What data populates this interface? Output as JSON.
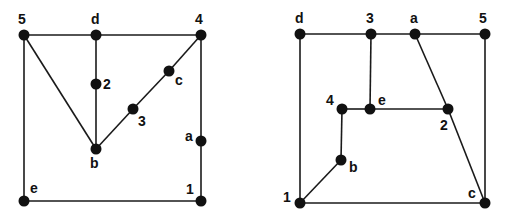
{
  "colors": {
    "background": "#ffffff",
    "ink": "#111111"
  },
  "graphs": [
    {
      "name": "left-graph",
      "nodes": [
        {
          "id": "5",
          "x": 24,
          "y": 35,
          "lx": 18,
          "ly": 24
        },
        {
          "id": "d",
          "x": 96,
          "y": 35,
          "lx": 91,
          "ly": 24
        },
        {
          "id": "4",
          "x": 201,
          "y": 35,
          "lx": 195,
          "ly": 24
        },
        {
          "id": "2",
          "x": 96,
          "y": 84,
          "lx": 103,
          "ly": 89
        },
        {
          "id": "c",
          "x": 169,
          "y": 71,
          "lx": 175,
          "ly": 85
        },
        {
          "id": "3",
          "x": 133,
          "y": 109,
          "lx": 138,
          "ly": 126
        },
        {
          "id": "b",
          "x": 96,
          "y": 149,
          "lx": 90,
          "ly": 168
        },
        {
          "id": "a",
          "x": 201,
          "y": 141,
          "lx": 185,
          "ly": 141
        },
        {
          "id": "e",
          "x": 24,
          "y": 201,
          "lx": 30,
          "ly": 193
        },
        {
          "id": "1",
          "x": 201,
          "y": 201,
          "lx": 186,
          "ly": 194
        }
      ],
      "edges": [
        [
          "5",
          "d"
        ],
        [
          "d",
          "4"
        ],
        [
          "5",
          "b"
        ],
        [
          "d",
          "2"
        ],
        [
          "2",
          "b"
        ],
        [
          "b",
          "3"
        ],
        [
          "3",
          "c"
        ],
        [
          "c",
          "4"
        ],
        [
          "4",
          "a"
        ],
        [
          "a",
          "1"
        ],
        [
          "5",
          "e"
        ],
        [
          "e",
          "1"
        ]
      ]
    },
    {
      "name": "right-graph",
      "nodes": [
        {
          "id": "d",
          "x": 300,
          "y": 34,
          "lx": 295,
          "ly": 23
        },
        {
          "id": "3",
          "x": 371,
          "y": 34,
          "lx": 366,
          "ly": 23
        },
        {
          "id": "a",
          "x": 415,
          "y": 34,
          "lx": 410,
          "ly": 23
        },
        {
          "id": "5",
          "x": 485,
          "y": 34,
          "lx": 479,
          "ly": 23
        },
        {
          "id": "4",
          "x": 342,
          "y": 109,
          "lx": 326,
          "ly": 105
        },
        {
          "id": "e",
          "x": 370,
          "y": 109,
          "lx": 378,
          "ly": 105
        },
        {
          "id": "2",
          "x": 448,
          "y": 109,
          "lx": 440,
          "ly": 130
        },
        {
          "id": "b",
          "x": 341,
          "y": 160,
          "lx": 349,
          "ly": 172
        },
        {
          "id": "1",
          "x": 300,
          "y": 203,
          "lx": 283,
          "ly": 202
        },
        {
          "id": "c",
          "x": 485,
          "y": 203,
          "lx": 468,
          "ly": 198
        }
      ],
      "edges": [
        [
          "d",
          "3"
        ],
        [
          "3",
          "a"
        ],
        [
          "a",
          "5"
        ],
        [
          "d",
          "1"
        ],
        [
          "5",
          "c"
        ],
        [
          "1",
          "c"
        ],
        [
          "3",
          "e"
        ],
        [
          "4",
          "e"
        ],
        [
          "e",
          "2"
        ],
        [
          "a",
          "2"
        ],
        [
          "2",
          "c"
        ],
        [
          "4",
          "b"
        ],
        [
          "b",
          "1"
        ]
      ]
    }
  ]
}
